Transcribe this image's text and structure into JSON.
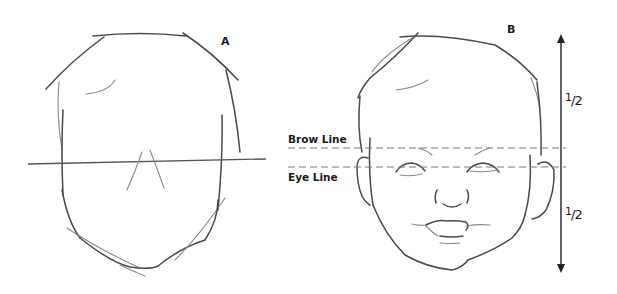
{
  "figure": {
    "panels": [
      {
        "id": "A",
        "label": "A",
        "description": "Basic blocked-in head shape with horizontal center line and nose guide"
      },
      {
        "id": "B",
        "label": "B",
        "description": "Baby face with features placed on guide lines"
      }
    ],
    "guide_lines": {
      "brow_label": "Brow Line",
      "eye_label": "Eye Line"
    },
    "measurement": {
      "upper_fraction": "1/2",
      "lower_fraction": "1/2",
      "upper_numerator": "1",
      "upper_denominator": "/2",
      "lower_numerator": "1",
      "lower_denominator": "/2"
    },
    "colors": {
      "pencil": "#4a4a4a",
      "guide_dash": "#7a7a7a",
      "arrow": "#222222",
      "background": "#ffffff"
    }
  }
}
